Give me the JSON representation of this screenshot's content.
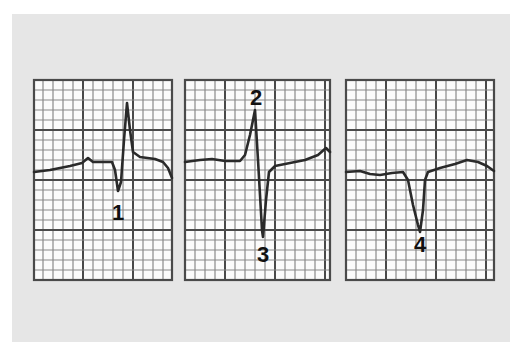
{
  "figure": {
    "background_color": "#e6e6e6",
    "grid_minor_color": "#8a8a8a",
    "grid_major_color": "#4a4a4a",
    "paper_color": "#fbfbfb",
    "trace_color": "#2a2a2a"
  },
  "panels": [
    {
      "id": "panel-1",
      "x": 34,
      "y": 80,
      "w": 138,
      "h": 200,
      "grid_offset_x": 9,
      "trace": [
        [
          34,
          172
        ],
        [
          50,
          170
        ],
        [
          70,
          166
        ],
        [
          82,
          163
        ],
        [
          88,
          158
        ],
        [
          93,
          162
        ],
        [
          112,
          162
        ],
        [
          115,
          170
        ],
        [
          118,
          191
        ],
        [
          121,
          182
        ],
        [
          124,
          140
        ],
        [
          127,
          103
        ],
        [
          130,
          130
        ],
        [
          133,
          152
        ],
        [
          140,
          157
        ],
        [
          155,
          159
        ],
        [
          163,
          162
        ],
        [
          168,
          168
        ],
        [
          172,
          178
        ]
      ],
      "markers": [
        {
          "label": "1",
          "x": 118,
          "y": 220
        }
      ]
    },
    {
      "id": "panel-2",
      "x": 185,
      "y": 80,
      "w": 145,
      "h": 200,
      "grid_offset_x": 0,
      "trace": [
        [
          185,
          162
        ],
        [
          200,
          160
        ],
        [
          212,
          159
        ],
        [
          225,
          161
        ],
        [
          240,
          161
        ],
        [
          245,
          155
        ],
        [
          250,
          135
        ],
        [
          255,
          110
        ],
        [
          258,
          160
        ],
        [
          262,
          230
        ],
        [
          263,
          237
        ],
        [
          266,
          200
        ],
        [
          269,
          172
        ],
        [
          275,
          166
        ],
        [
          290,
          163
        ],
        [
          305,
          160
        ],
        [
          318,
          155
        ],
        [
          326,
          148
        ],
        [
          330,
          152
        ]
      ],
      "markers": [
        {
          "label": "2",
          "x": 256,
          "y": 105
        },
        {
          "label": "3",
          "x": 263,
          "y": 262
        }
      ]
    },
    {
      "id": "panel-3",
      "x": 346,
      "y": 80,
      "w": 148,
      "h": 200,
      "grid_offset_x": 0,
      "trace": [
        [
          346,
          172
        ],
        [
          360,
          171
        ],
        [
          370,
          174
        ],
        [
          380,
          175
        ],
        [
          392,
          173
        ],
        [
          403,
          172
        ],
        [
          408,
          180
        ],
        [
          413,
          205
        ],
        [
          418,
          225
        ],
        [
          420,
          232
        ],
        [
          423,
          210
        ],
        [
          425,
          180
        ],
        [
          428,
          172
        ],
        [
          440,
          168
        ],
        [
          455,
          164
        ],
        [
          467,
          160
        ],
        [
          478,
          162
        ],
        [
          487,
          166
        ],
        [
          494,
          171
        ]
      ],
      "markers": [
        {
          "label": "4",
          "x": 420,
          "y": 252
        }
      ]
    }
  ]
}
